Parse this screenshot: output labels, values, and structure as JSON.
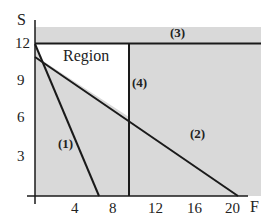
{
  "diagram": {
    "type": "feasible-region",
    "axes": {
      "x_label": "F",
      "y_label": "S",
      "x_ticks": [
        "4",
        "8",
        "12",
        "16",
        "20"
      ],
      "y_ticks": [
        "3",
        "6",
        "9",
        "12"
      ]
    },
    "region_label": "Region",
    "constraints": [
      {
        "id": "1",
        "label": "(1)"
      },
      {
        "id": "2",
        "label": "(2)"
      },
      {
        "id": "3",
        "label": "(3)"
      },
      {
        "id": "4",
        "label": "(4)"
      }
    ],
    "colors": {
      "shade": "#d9d9d9",
      "line": "#1a1a1a",
      "region": "#ffffff"
    }
  }
}
